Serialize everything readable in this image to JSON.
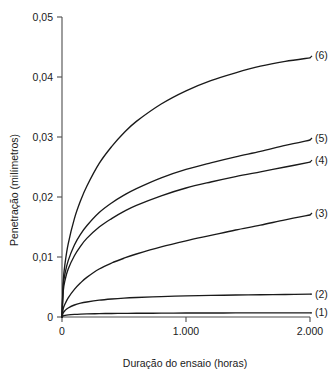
{
  "chart_data": {
    "type": "line",
    "title": "",
    "subtitle": "",
    "xlabel": "Duração do ensaio (horas)",
    "ylabel": "Penetração (milímetros)",
    "xlim": [
      0,
      2000
    ],
    "ylim": [
      0,
      0.05
    ],
    "grid": false,
    "legend_position": "right-inline-labels",
    "x_ticks": [
      0,
      1000,
      2000
    ],
    "x_tick_labels": [
      "0",
      "1.000",
      "2.000"
    ],
    "y_ticks": [
      0,
      0.01,
      0.02,
      0.03,
      0.04,
      0.05
    ],
    "y_tick_labels": [
      "0",
      "0,01",
      "0,02",
      "0,03",
      "0,04",
      "0,05"
    ],
    "x": [
      0,
      10,
      25,
      50,
      100,
      150,
      200,
      300,
      400,
      500,
      600,
      800,
      1000,
      1200,
      1400,
      1600,
      1800,
      2000
    ],
    "series": [
      {
        "name": "(1)",
        "label": "(1)",
        "end_value": 0.0007,
        "values": [
          0,
          0.00018,
          0.00028,
          0.00036,
          0.00044,
          0.00049,
          0.00052,
          0.00056,
          0.00059,
          0.00061,
          0.00062,
          0.00064,
          0.00066,
          0.00067,
          0.00068,
          0.00069,
          0.00069,
          0.0007
        ]
      },
      {
        "name": "(2)",
        "label": "(2)",
        "end_value": 0.0038,
        "values": [
          0,
          0.0007,
          0.0011,
          0.0015,
          0.002,
          0.0023,
          0.0025,
          0.0028,
          0.003,
          0.00315,
          0.00325,
          0.0034,
          0.00352,
          0.0036,
          0.00366,
          0.00371,
          0.00375,
          0.0038
        ]
      },
      {
        "name": "(3)",
        "label": "(3)",
        "end_value": 0.017,
        "values": [
          0,
          0.0014,
          0.0022,
          0.0032,
          0.0046,
          0.0057,
          0.0066,
          0.008,
          0.009,
          0.0098,
          0.0105,
          0.0117,
          0.0127,
          0.0136,
          0.0145,
          0.0153,
          0.0162,
          0.017
        ]
      },
      {
        "name": "(4)",
        "label": "(4)",
        "end_value": 0.0258,
        "values": [
          0,
          0.0043,
          0.0062,
          0.008,
          0.0102,
          0.0118,
          0.0131,
          0.015,
          0.0164,
          0.0176,
          0.0186,
          0.0202,
          0.0215,
          0.0225,
          0.0234,
          0.0242,
          0.025,
          0.0258
        ]
      },
      {
        "name": "(5)",
        "label": "(5)",
        "end_value": 0.0295,
        "values": [
          0,
          0.0052,
          0.0073,
          0.0094,
          0.012,
          0.0138,
          0.0152,
          0.0174,
          0.019,
          0.0203,
          0.0214,
          0.0232,
          0.0246,
          0.0257,
          0.0267,
          0.0276,
          0.0286,
          0.0295
        ]
      },
      {
        "name": "(6)",
        "label": "(6)",
        "end_value": 0.0432,
        "values": [
          0,
          0.006,
          0.009,
          0.0122,
          0.0164,
          0.0194,
          0.0218,
          0.0256,
          0.0284,
          0.0307,
          0.0326,
          0.0355,
          0.0377,
          0.0394,
          0.0407,
          0.0418,
          0.0426,
          0.0432
        ]
      }
    ],
    "colors": {
      "curve": "#1a1a1a",
      "axis": "#4d4d4d",
      "background": "#ffffff"
    }
  }
}
